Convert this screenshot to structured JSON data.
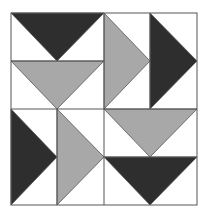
{
  "colors": {
    "background": "#ffffff",
    "dark": "#2e2e2e",
    "gray": "#a8a8a8",
    "line": "#555555"
  },
  "grid": {
    "x": [
      11,
      57,
      104,
      150,
      197
    ],
    "y": [
      13,
      61,
      109,
      157,
      205
    ]
  },
  "quadrants": [
    {
      "name": "top-left",
      "direction": "down",
      "triangles": [
        {
          "fill": "dark",
          "points": "11,13 104,13 57,61"
        },
        {
          "fill": "gray",
          "points": "11,61 104,61 57,109"
        }
      ]
    },
    {
      "name": "top-right",
      "direction": "right",
      "triangles": [
        {
          "fill": "gray",
          "points": "104,13 104,109 150,61"
        },
        {
          "fill": "dark",
          "points": "150,13 150,109 197,61"
        }
      ]
    },
    {
      "name": "bottom-left",
      "direction": "right",
      "triangles": [
        {
          "fill": "dark",
          "points": "11,109 11,205 57,157"
        },
        {
          "fill": "gray",
          "points": "57,109 57,205 104,157"
        }
      ]
    },
    {
      "name": "bottom-right",
      "direction": "down",
      "triangles": [
        {
          "fill": "gray",
          "points": "104,109 197,109 150,157"
        },
        {
          "fill": "dark",
          "points": "104,157 197,157 150,205"
        }
      ]
    }
  ]
}
